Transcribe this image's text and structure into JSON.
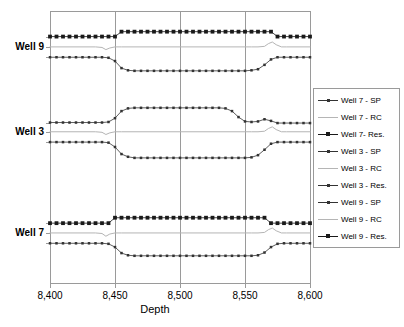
{
  "chart_data": {
    "type": "line",
    "title": "",
    "xlabel": "Depth",
    "ylabel": "",
    "xlim": [
      8400,
      8600
    ],
    "xticks": [
      8400,
      8450,
      8500,
      8550,
      8600
    ],
    "xticklabels": [
      "8,400",
      "8,450",
      "8,500",
      "8,550",
      "8,600"
    ],
    "yticklabels": [
      "Well 9",
      "Well 3",
      "Well 7"
    ],
    "ylim": [
      0,
      100
    ],
    "grid": "vertical-only",
    "legend_position": "right-outside",
    "series": [
      {
        "name": "Well 7 - SP",
        "marker": "small-square",
        "color": "#333333",
        "group": "Well 7",
        "x": [
          8400,
          8405,
          8410,
          8415,
          8420,
          8425,
          8430,
          8435,
          8440,
          8445,
          8450,
          8455,
          8460,
          8465,
          8470,
          8475,
          8480,
          8485,
          8490,
          8495,
          8500,
          8505,
          8510,
          8515,
          8520,
          8525,
          8530,
          8535,
          8540,
          8545,
          8550,
          8555,
          8560,
          8565,
          8570,
          8575,
          8580,
          8585,
          8590,
          8595,
          8600
        ],
        "y": [
          14.6,
          14.6,
          14.6,
          14.6,
          14.6,
          14.6,
          14.6,
          14.6,
          14.6,
          14.4,
          13.2,
          11.0,
          10.2,
          10.0,
          10.0,
          10.0,
          10.0,
          10.0,
          10.0,
          10.0,
          10.0,
          10.0,
          10.0,
          10.0,
          10.0,
          10.0,
          10.0,
          10.0,
          10.0,
          10.0,
          10.0,
          10.0,
          10.2,
          11.2,
          13.2,
          14.4,
          14.6,
          14.6,
          14.6,
          14.6,
          14.6
        ]
      },
      {
        "name": "Well 7 - RC",
        "marker": "none",
        "color": "#b5b5b5",
        "group": "Well 7",
        "x": [
          8400,
          8410,
          8420,
          8430,
          8435,
          8440,
          8443,
          8446,
          8450,
          8455,
          8460,
          8470,
          8480,
          8490,
          8500,
          8510,
          8520,
          8530,
          8540,
          8550,
          8555,
          8560,
          8565,
          8568,
          8571,
          8574,
          8578,
          8582,
          8590,
          8600
        ],
        "y": [
          18.4,
          18.4,
          18.4,
          18.4,
          18.4,
          18.2,
          17.2,
          18.0,
          18.4,
          18.4,
          18.4,
          18.4,
          18.4,
          18.4,
          18.4,
          18.4,
          18.4,
          18.4,
          18.4,
          18.4,
          18.4,
          18.4,
          18.6,
          19.6,
          20.2,
          19.2,
          18.4,
          18.4,
          18.4,
          18.4
        ]
      },
      {
        "name": "Well 7-  Res.",
        "marker": "large-square",
        "color": "#1a1a1a",
        "group": "Well 7",
        "x": [
          8400,
          8405,
          8410,
          8415,
          8420,
          8425,
          8430,
          8435,
          8440,
          8445,
          8450,
          8455,
          8460,
          8465,
          8470,
          8475,
          8480,
          8485,
          8490,
          8495,
          8500,
          8505,
          8510,
          8515,
          8520,
          8525,
          8530,
          8535,
          8540,
          8545,
          8550,
          8555,
          8560,
          8565,
          8570,
          8575,
          8580,
          8585,
          8590,
          8595,
          8600
        ],
        "y": [
          22.0,
          22.0,
          22.0,
          22.0,
          22.0,
          22.0,
          22.0,
          22.0,
          22.0,
          22.0,
          24.0,
          24.0,
          24.0,
          24.0,
          24.0,
          24.0,
          24.0,
          24.0,
          24.0,
          24.0,
          24.0,
          24.0,
          24.0,
          24.0,
          24.0,
          24.0,
          24.0,
          24.0,
          24.0,
          24.0,
          24.0,
          24.0,
          24.0,
          24.0,
          22.0,
          22.0,
          22.0,
          22.0,
          22.0,
          22.0,
          22.0
        ]
      },
      {
        "name": "Well 3 - SP",
        "marker": "small-square",
        "color": "#333333",
        "group": "Well 3",
        "x": [
          8400,
          8405,
          8410,
          8415,
          8420,
          8425,
          8430,
          8435,
          8440,
          8445,
          8450,
          8455,
          8460,
          8465,
          8470,
          8475,
          8480,
          8485,
          8490,
          8495,
          8500,
          8505,
          8510,
          8515,
          8520,
          8525,
          8530,
          8535,
          8540,
          8545,
          8550,
          8555,
          8560,
          8565,
          8570,
          8575,
          8580,
          8585,
          8590,
          8595,
          8600
        ],
        "y": [
          51.8,
          51.8,
          51.8,
          51.8,
          51.8,
          51.8,
          51.8,
          51.8,
          51.8,
          51.6,
          50.0,
          47.4,
          46.4,
          46.0,
          46.0,
          46.0,
          46.0,
          46.0,
          46.0,
          46.0,
          46.0,
          46.0,
          46.0,
          46.0,
          46.0,
          46.0,
          46.0,
          46.0,
          46.0,
          46.0,
          46.0,
          46.2,
          47.0,
          49.0,
          51.2,
          51.8,
          51.8,
          51.8,
          51.8,
          51.8,
          51.8
        ]
      },
      {
        "name": "Well 3 - RC",
        "marker": "none",
        "color": "#b5b5b5",
        "group": "Well 3",
        "x": [
          8400,
          8410,
          8420,
          8430,
          8435,
          8440,
          8443,
          8446,
          8450,
          8455,
          8460,
          8470,
          8480,
          8490,
          8500,
          8510,
          8520,
          8530,
          8540,
          8550,
          8555,
          8560,
          8565,
          8568,
          8571,
          8574,
          8578,
          8582,
          8590,
          8600
        ],
        "y": [
          55.6,
          55.6,
          55.6,
          55.6,
          55.6,
          55.4,
          54.6,
          55.2,
          55.6,
          55.6,
          55.6,
          55.6,
          55.6,
          55.6,
          55.6,
          55.6,
          55.6,
          55.6,
          55.6,
          55.6,
          55.6,
          55.6,
          55.8,
          56.8,
          57.4,
          56.4,
          55.6,
          55.6,
          55.6,
          55.6
        ]
      },
      {
        "name": "Well 3 - Res.",
        "marker": "small-square",
        "color": "#333333",
        "group": "Well 3",
        "x": [
          8400,
          8405,
          8410,
          8415,
          8420,
          8425,
          8430,
          8435,
          8440,
          8445,
          8450,
          8455,
          8460,
          8465,
          8470,
          8475,
          8480,
          8485,
          8490,
          8495,
          8500,
          8505,
          8510,
          8515,
          8520,
          8525,
          8530,
          8535,
          8540,
          8545,
          8550,
          8555,
          8560,
          8565,
          8570,
          8575,
          8580,
          8585,
          8590,
          8595,
          8600
        ],
        "y": [
          59.0,
          59.0,
          59.0,
          59.0,
          59.0,
          59.0,
          59.0,
          59.0,
          59.0,
          59.2,
          60.6,
          63.2,
          64.2,
          64.4,
          64.4,
          64.4,
          64.4,
          64.4,
          64.4,
          64.4,
          64.4,
          64.4,
          64.4,
          64.4,
          64.4,
          64.4,
          64.4,
          64.2,
          63.2,
          61.0,
          59.4,
          59.2,
          59.4,
          60.2,
          59.6,
          58.8,
          58.8,
          58.8,
          58.8,
          58.8,
          58.8
        ]
      },
      {
        "name": "Well 9 - SP",
        "marker": "small-square",
        "color": "#333333",
        "group": "Well 9",
        "x": [
          8400,
          8405,
          8410,
          8415,
          8420,
          8425,
          8430,
          8435,
          8440,
          8445,
          8450,
          8455,
          8460,
          8465,
          8470,
          8475,
          8480,
          8485,
          8490,
          8495,
          8500,
          8505,
          8510,
          8515,
          8520,
          8525,
          8530,
          8535,
          8540,
          8545,
          8550,
          8555,
          8560,
          8565,
          8570,
          8575,
          8580,
          8585,
          8590,
          8595,
          8600
        ],
        "y": [
          83.0,
          83.0,
          83.0,
          83.0,
          83.0,
          83.0,
          83.0,
          83.0,
          83.0,
          82.8,
          81.6,
          79.0,
          78.2,
          78.0,
          78.0,
          78.0,
          78.0,
          78.0,
          78.0,
          78.0,
          78.0,
          78.0,
          78.0,
          78.0,
          78.0,
          78.0,
          78.0,
          78.0,
          78.0,
          78.0,
          78.0,
          78.2,
          78.6,
          80.2,
          82.2,
          83.0,
          83.0,
          83.0,
          83.0,
          83.0,
          83.0
        ]
      },
      {
        "name": "Well 9 - RC",
        "marker": "none",
        "color": "#b5b5b5",
        "group": "Well 9",
        "x": [
          8400,
          8410,
          8420,
          8430,
          8435,
          8440,
          8443,
          8446,
          8450,
          8455,
          8460,
          8470,
          8480,
          8490,
          8500,
          8510,
          8520,
          8530,
          8540,
          8550,
          8555,
          8560,
          8565,
          8568,
          8571,
          8574,
          8578,
          8582,
          8590,
          8600
        ],
        "y": [
          86.8,
          86.8,
          86.8,
          86.8,
          86.8,
          86.6,
          85.8,
          86.4,
          86.8,
          86.8,
          86.8,
          86.8,
          86.8,
          86.8,
          86.8,
          86.8,
          86.8,
          86.8,
          86.8,
          86.8,
          86.8,
          86.8,
          87.0,
          88.0,
          88.6,
          87.6,
          86.8,
          86.8,
          86.8,
          86.8
        ]
      },
      {
        "name": "Well 9 - Res.",
        "marker": "large-square",
        "color": "#1a1a1a",
        "group": "Well 9",
        "x": [
          8400,
          8405,
          8410,
          8415,
          8420,
          8425,
          8430,
          8435,
          8440,
          8445,
          8450,
          8455,
          8460,
          8465,
          8470,
          8475,
          8480,
          8485,
          8490,
          8495,
          8500,
          8505,
          8510,
          8515,
          8520,
          8525,
          8530,
          8535,
          8540,
          8545,
          8550,
          8555,
          8560,
          8565,
          8570,
          8575,
          8580,
          8585,
          8590,
          8595,
          8600
        ],
        "y": [
          90.6,
          90.6,
          90.6,
          90.6,
          90.6,
          90.6,
          90.6,
          90.6,
          90.6,
          90.6,
          90.6,
          92.4,
          92.4,
          92.4,
          92.4,
          92.4,
          92.4,
          92.4,
          92.4,
          92.4,
          92.4,
          92.4,
          92.4,
          92.4,
          92.4,
          92.4,
          92.4,
          92.4,
          92.4,
          92.4,
          92.4,
          92.4,
          92.4,
          92.4,
          92.4,
          90.6,
          90.6,
          90.6,
          90.6,
          90.6,
          90.6
        ]
      }
    ]
  },
  "legend": {
    "entries": [
      {
        "label": "Well 7 - SP",
        "key": "small-square-line"
      },
      {
        "label": "Well 7 - RC",
        "key": "plain-light-line"
      },
      {
        "label": "Well 7-  Res.",
        "key": "large-square-line"
      },
      {
        "label": "Well 3 - SP",
        "key": "small-square-line"
      },
      {
        "label": "Well 3 - RC",
        "key": "plain-light-line"
      },
      {
        "label": "Well 3 - Res.",
        "key": "small-square-line"
      },
      {
        "label": "Well 9 - SP",
        "key": "small-square-line"
      },
      {
        "label": "Well 9 - RC",
        "key": "plain-light-line"
      },
      {
        "label": "Well 9 - Res.",
        "key": "large-square-line"
      }
    ]
  },
  "axes": {
    "y_labels": [
      {
        "text": "Well 9",
        "value": 86.8
      },
      {
        "text": "Well 3",
        "value": 55.6
      },
      {
        "text": "Well 7",
        "value": 18.4
      }
    ],
    "x_title": "Depth",
    "x_ticklabels": [
      "8,400",
      "8,450",
      "8,500",
      "8,550",
      "8,600"
    ]
  },
  "colors": {
    "axis": "#9a9a9a",
    "grid": "#9a9a9a",
    "dark_series": "#1a1a1a",
    "mid_series": "#333333",
    "light_series": "#b5b5b5",
    "background": "#ffffff"
  }
}
